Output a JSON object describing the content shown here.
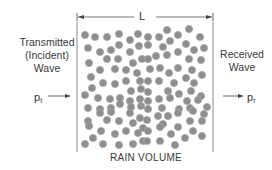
{
  "diagram": {
    "dimension_label": "L",
    "left_label": [
      "Transmitted",
      "(Incident)",
      "Wave"
    ],
    "right_label": [
      "Received",
      "Wave"
    ],
    "bottom_label": "RAIN VOLUME",
    "input_power": {
      "symbol": "p",
      "subscript": "t"
    },
    "output_power": {
      "symbol": "p",
      "subscript": "r"
    },
    "colors": {
      "line": "#888888",
      "drop_fill": "#8e8e8e",
      "drop_stroke": "#a6a6a6",
      "text": "#3a3a3a"
    },
    "box": {
      "x1": 77,
      "x2": 213,
      "y1": 22,
      "y2": 152
    },
    "drop_radius": 3.6,
    "drops": [
      [
        85,
        35
      ],
      [
        95,
        37
      ],
      [
        107,
        37
      ],
      [
        119,
        34
      ],
      [
        130,
        40
      ],
      [
        138,
        34
      ],
      [
        88,
        48
      ],
      [
        100,
        52
      ],
      [
        111,
        50
      ],
      [
        119,
        45
      ],
      [
        130,
        52
      ],
      [
        139,
        46
      ],
      [
        89,
        63
      ],
      [
        107,
        59
      ],
      [
        118,
        59
      ],
      [
        133,
        63
      ],
      [
        142,
        59
      ],
      [
        148,
        37
      ],
      [
        167,
        30
      ],
      [
        178,
        35
      ],
      [
        189,
        29
      ],
      [
        159,
        37
      ],
      [
        170,
        41
      ],
      [
        200,
        37
      ],
      [
        148,
        45
      ],
      [
        163,
        47
      ],
      [
        186,
        44
      ],
      [
        194,
        50
      ],
      [
        204,
        48
      ],
      [
        178,
        52
      ],
      [
        167,
        55
      ],
      [
        156,
        56
      ],
      [
        148,
        59
      ],
      [
        189,
        59
      ],
      [
        201,
        60
      ],
      [
        100,
        70
      ],
      [
        115,
        69
      ],
      [
        126,
        70
      ],
      [
        137,
        73
      ],
      [
        91,
        77
      ],
      [
        103,
        83
      ],
      [
        115,
        84
      ],
      [
        126,
        81
      ],
      [
        140,
        81
      ],
      [
        92,
        88
      ],
      [
        85,
        95
      ],
      [
        98,
        98
      ],
      [
        110,
        99
      ],
      [
        120,
        98
      ],
      [
        131,
        91
      ],
      [
        141,
        89
      ],
      [
        130,
        101
      ],
      [
        140,
        99
      ],
      [
        88,
        108
      ],
      [
        100,
        109
      ],
      [
        111,
        108
      ],
      [
        120,
        104
      ],
      [
        131,
        107
      ],
      [
        141,
        106
      ],
      [
        150,
        69
      ],
      [
        160,
        68
      ],
      [
        169,
        73
      ],
      [
        178,
        68
      ],
      [
        192,
        70
      ],
      [
        202,
        75
      ],
      [
        148,
        81
      ],
      [
        159,
        81
      ],
      [
        174,
        83
      ],
      [
        186,
        78
      ],
      [
        194,
        83
      ],
      [
        148,
        92
      ],
      [
        168,
        91
      ],
      [
        179,
        94
      ],
      [
        191,
        91
      ],
      [
        201,
        96
      ],
      [
        159,
        99
      ],
      [
        170,
        98
      ],
      [
        148,
        101
      ],
      [
        187,
        101
      ],
      [
        198,
        100
      ],
      [
        148,
        109
      ],
      [
        162,
        108
      ],
      [
        179,
        109
      ],
      [
        190,
        108
      ],
      [
        207,
        107
      ],
      [
        88,
        121
      ],
      [
        100,
        113
      ],
      [
        111,
        112
      ],
      [
        130,
        113
      ],
      [
        140,
        118
      ],
      [
        89,
        126
      ],
      [
        107,
        120
      ],
      [
        119,
        121
      ],
      [
        133,
        123
      ],
      [
        143,
        128
      ],
      [
        101,
        131
      ],
      [
        115,
        134
      ],
      [
        126,
        131
      ],
      [
        138,
        133
      ],
      [
        93,
        138
      ],
      [
        85,
        144
      ],
      [
        103,
        144
      ],
      [
        119,
        145
      ],
      [
        133,
        144
      ],
      [
        143,
        141
      ],
      [
        147,
        120
      ],
      [
        158,
        116
      ],
      [
        168,
        116
      ],
      [
        163,
        124
      ],
      [
        178,
        113
      ],
      [
        193,
        111
      ],
      [
        204,
        114
      ],
      [
        190,
        121
      ],
      [
        202,
        121
      ],
      [
        148,
        131
      ],
      [
        160,
        127
      ],
      [
        171,
        134
      ],
      [
        178,
        127
      ],
      [
        193,
        131
      ],
      [
        202,
        136
      ],
      [
        147,
        141
      ],
      [
        160,
        141
      ],
      [
        185,
        138
      ],
      [
        175,
        145
      ]
    ]
  }
}
